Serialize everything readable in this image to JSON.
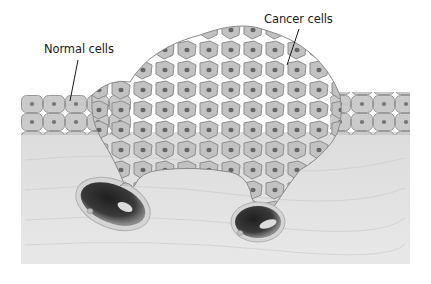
{
  "diagram": {
    "type": "biology-illustration",
    "labels": {
      "normal_cells": "Normal cells",
      "cancer_cells": "Cancer cells"
    },
    "colors": {
      "background": "#ffffff",
      "connective_tissue": "#e3e3e3",
      "cell_fill": "#c4c4c4",
      "cell_border": "#8f8f8f",
      "nucleus": "#6a6a6a",
      "vessel_lumen": "#2e2e2e",
      "vessel_wall": "#cfcfcf",
      "label_text": "#1a1a1a"
    }
  }
}
